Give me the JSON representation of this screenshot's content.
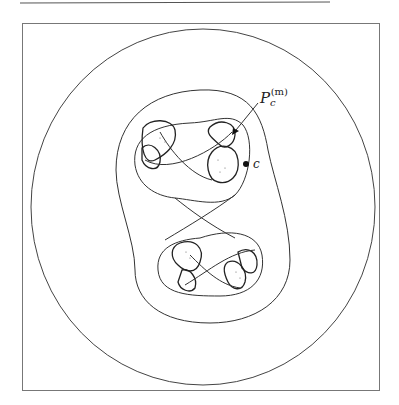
{
  "figure": {
    "type": "polynomial-like mapping / Julia set diagram",
    "labels": {
      "pc_main": "P",
      "pc_sub": "c",
      "pc_sup": "(m)",
      "point_c": "c"
    },
    "colors": {
      "stroke": "#333333",
      "frame": "#777777",
      "background": "#ffffff"
    },
    "curves": [
      "outer-ellipse",
      "middle-oval",
      "inner-peanut",
      "filled-julia-lobes",
      "figure-eight-crossings"
    ]
  }
}
